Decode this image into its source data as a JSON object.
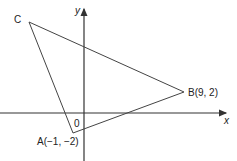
{
  "diagram": {
    "type": "coordinate-geometry-triangle",
    "axes": {
      "x_label": "x",
      "y_label": "y",
      "origin_label": "0"
    },
    "points": {
      "A": {
        "label": "A(−1, −2)",
        "x": -1,
        "y": -2
      },
      "B": {
        "label": "B(9, 2)",
        "x": 9,
        "y": 2
      },
      "C": {
        "label": "C"
      }
    },
    "colors": {
      "line": "#333333",
      "axis": "#333333",
      "text": "#222222"
    }
  }
}
